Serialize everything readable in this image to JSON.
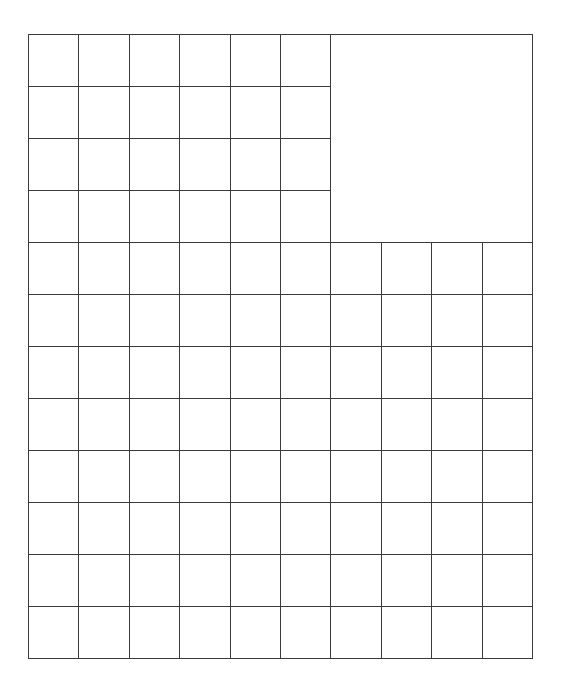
{
  "diagram": {
    "type": "grid",
    "columns": 10,
    "rows": 12,
    "cell_width": 50.4,
    "cell_height": 52,
    "line_color": "#3a3a3a",
    "background": "#ffffff",
    "merged_regions": [
      {
        "col_start": 6,
        "row_start": 0,
        "col_span": 4,
        "row_span": 4,
        "label": ""
      }
    ],
    "cell_labels": []
  }
}
